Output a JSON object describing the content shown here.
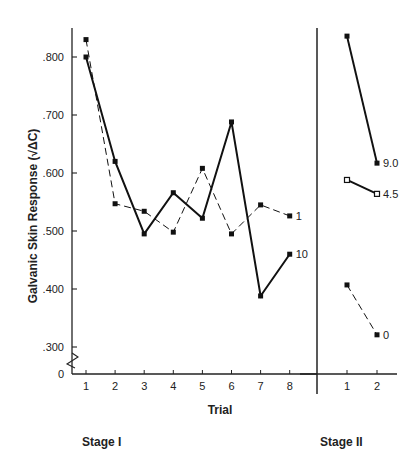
{
  "chart_data": {
    "type": "line",
    "title": "",
    "ylabel": "Galvanic Skin Response (√ΔC)",
    "xlabel": "Trial",
    "ylim": [
      0.25,
      0.85
    ],
    "y_axis_break": true,
    "y_ticks": [
      {
        "value": 0.8,
        "label": ".800"
      },
      {
        "value": 0.7,
        "label": ".700"
      },
      {
        "value": 0.6,
        "label": ".600"
      },
      {
        "value": 0.5,
        "label": ".500"
      },
      {
        "value": 0.4,
        "label": ".400"
      },
      {
        "value": 0.3,
        "label": ".300"
      },
      {
        "value": 0.0,
        "label": "0"
      }
    ],
    "grid": false,
    "panels": [
      {
        "name": "Stage I",
        "x": [
          1,
          2,
          3,
          4,
          5,
          6,
          7,
          8
        ],
        "series": [
          {
            "name": "1",
            "style": "dashed",
            "marker": "filled-square",
            "values": [
              0.83,
              0.547,
              0.534,
              0.498,
              0.608,
              0.495,
              0.545,
              0.526
            ]
          },
          {
            "name": "10",
            "style": "solid",
            "marker": "filled-square",
            "values": [
              0.8,
              0.62,
              0.495,
              0.566,
              0.522,
              0.688,
              0.388,
              0.46
            ]
          }
        ]
      },
      {
        "name": "Stage II",
        "x": [
          1,
          2
        ],
        "series": [
          {
            "name": "9.0",
            "style": "solid",
            "marker": "filled-square",
            "values": [
              0.836,
              0.617
            ]
          },
          {
            "name": "4.5",
            "style": "solid",
            "marker": "open-square",
            "values": [
              0.588,
              0.564
            ]
          },
          {
            "name": "0",
            "style": "dashed",
            "marker": "filled-square",
            "values": [
              0.407,
              0.321
            ]
          }
        ]
      }
    ]
  },
  "labels": {
    "y_axis": "Galvanic Skin Response (√ΔC)",
    "x_axis": "Trial",
    "stage1": "Stage I",
    "stage2": "Stage II"
  }
}
